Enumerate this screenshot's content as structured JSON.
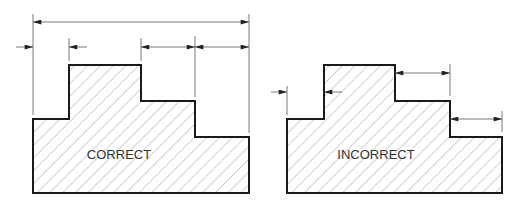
{
  "diagram": {
    "left": {
      "label": "CORRECT",
      "outline_points": "33,193 33,119 69,119 69,65 141,65 141,101 195,101 195,137 249,137 249,193",
      "extension_lines": [
        {
          "x1": 33,
          "y1": 14,
          "x2": 33,
          "y2": 115
        },
        {
          "x1": 69,
          "y1": 38,
          "x2": 69,
          "y2": 61
        },
        {
          "x1": 141,
          "y1": 38,
          "x2": 141,
          "y2": 61
        },
        {
          "x1": 195,
          "y1": 36,
          "x2": 195,
          "y2": 97
        },
        {
          "x1": 249,
          "y1": 14,
          "x2": 249,
          "y2": 133
        }
      ],
      "dimensions": [
        {
          "name": "overall",
          "x1": 33,
          "y1": 22,
          "x2": 249,
          "y2": 22,
          "arrows": "inside"
        },
        {
          "name": "left-step",
          "x1": 16,
          "y1": 47,
          "x2": 33,
          "y2": 47,
          "arrows": "outside-left"
        },
        {
          "name": "left-step-b",
          "x1": 69,
          "y1": 47,
          "x2": 87,
          "y2": 47,
          "arrows": "outside-right"
        },
        {
          "name": "middle-step",
          "x1": 141,
          "y1": 47,
          "x2": 195,
          "y2": 47,
          "arrows": "inside"
        },
        {
          "name": "right-step",
          "x1": 195,
          "y1": 47,
          "x2": 249,
          "y2": 47,
          "arrows": "inside"
        }
      ],
      "label_x": 119,
      "label_y": 159
    },
    "right": {
      "label": "INCORRECT",
      "outline_points": "287,193 287,119 324,119 324,65 395,65 395,101 450,101 450,137 502,137 502,193",
      "extension_lines": [
        {
          "x1": 287,
          "y1": 86,
          "x2": 287,
          "y2": 115
        },
        {
          "x1": 450,
          "y1": 64,
          "x2": 450,
          "y2": 96
        },
        {
          "x1": 502,
          "y1": 111,
          "x2": 502,
          "y2": 132
        }
      ],
      "dimensions": [
        {
          "name": "left-step",
          "x1": 271,
          "y1": 92,
          "x2": 287,
          "y2": 92,
          "arrows": "outside-left"
        },
        {
          "name": "left-step-b",
          "x1": 324,
          "y1": 92,
          "x2": 342,
          "y2": 92,
          "arrows": "outside-right"
        },
        {
          "name": "middle-step",
          "x1": 395,
          "y1": 73,
          "x2": 450,
          "y2": 73,
          "arrows": "inside"
        },
        {
          "name": "right-step",
          "x1": 450,
          "y1": 119,
          "x2": 502,
          "y2": 119,
          "arrows": "inside"
        }
      ],
      "label_x": 376,
      "label_y": 159
    }
  },
  "colors": {
    "outline": "#1a1a1a",
    "hatch": "#999999",
    "dimension": "#555555"
  }
}
